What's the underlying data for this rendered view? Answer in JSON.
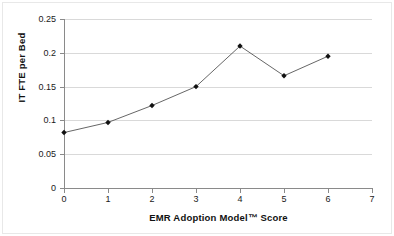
{
  "chart_data": {
    "type": "line",
    "title": "",
    "xlabel": "EMR Adoption Model™ Score",
    "ylabel": "IT FTE per Bed",
    "x": [
      0,
      1,
      2,
      3,
      4,
      5,
      6
    ],
    "values": [
      0.082,
      0.097,
      0.122,
      0.15,
      0.21,
      0.166,
      0.195
    ],
    "series": [
      {
        "name": "IT FTE per Bed",
        "values": [
          0.082,
          0.097,
          0.122,
          0.15,
          0.21,
          0.166,
          0.195
        ]
      }
    ],
    "xlim": [
      0,
      7
    ],
    "ylim": [
      0,
      0.25
    ],
    "xticks": [
      "0",
      "1",
      "2",
      "3",
      "4",
      "5",
      "6",
      "7"
    ],
    "yticks": [
      "0",
      "0.05",
      "0.1",
      "0.15",
      "0.2",
      "0.25"
    ],
    "ytick_values": [
      0,
      0.05,
      0.1,
      0.15,
      0.2,
      0.25
    ],
    "grid": "horizontal",
    "legend": "none",
    "marker": "filled-diamond",
    "line_color": "#555555",
    "marker_color": "#111111",
    "grid_color": "#d9d9d9",
    "axis_color": "#8a8a8a",
    "background": "#ffffff"
  },
  "axes": {
    "x_title": "EMR Adoption Model™ Score",
    "y_title": "IT FTE per Bed"
  }
}
